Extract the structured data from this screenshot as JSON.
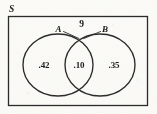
{
  "figure": {
    "type": "venn-diagram",
    "universe_label": "S",
    "outside_count_label": "9",
    "sets": [
      {
        "key": "A",
        "label": "A",
        "value": ".42"
      },
      {
        "key": "B",
        "label": "B",
        "value": ".35"
      }
    ],
    "intersection": {
      "label": "A and B",
      "value": ".10"
    },
    "regions": [
      {
        "name": "a-only",
        "value": ".42"
      },
      {
        "name": "intersection",
        "value": ".10"
      },
      {
        "name": "b-only",
        "value": ".35"
      }
    ],
    "colors": {
      "stroke": "#2b2b2b",
      "text": "#1d1d1d",
      "background": "#fdfdfb"
    }
  }
}
